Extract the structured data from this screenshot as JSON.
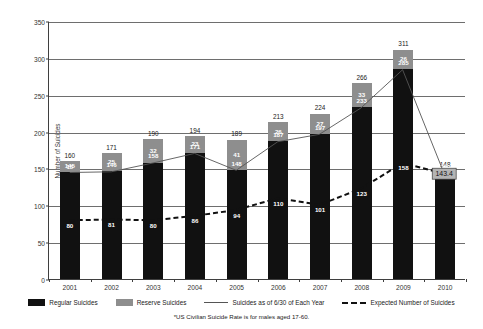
{
  "chart_data": {
    "type": "bar",
    "title": "",
    "xlabel": "",
    "ylabel": "Number of Suicides",
    "ylim": [
      0,
      350
    ],
    "ytick_step": 50,
    "yticks": [
      "0",
      "50",
      "100",
      "150",
      "200",
      "250",
      "300",
      "350"
    ],
    "grid": true,
    "legend_position": "bottom",
    "stacked": true,
    "categories": [
      "2001",
      "2002",
      "2003",
      "2004",
      "2005",
      "2006",
      "2007",
      "2008",
      "2009",
      "2010"
    ],
    "series": [
      {
        "name": "Regular Suicides",
        "type": "bar",
        "color": "#111111",
        "values": [
          145,
          146,
          158,
          171,
          148,
          187,
          197,
          233,
          285,
          139
        ]
      },
      {
        "name": "Reserve Suicides",
        "type": "bar",
        "color": "#8e8e8e",
        "values": [
          15,
          25,
          32,
          23,
          41,
          26,
          27,
          33,
          26,
          9
        ]
      },
      {
        "name": "Suicides as of 6/30 of Each Year",
        "type": "line",
        "style": "solid",
        "color": "#555555",
        "values": [
          145,
          146,
          158,
          171,
          148,
          187,
          197,
          233,
          285,
          143.4
        ]
      },
      {
        "name": "Expected Number of Suicides",
        "type": "line",
        "style": "dashed",
        "color": "#111111",
        "values": [
          80,
          81,
          80,
          86,
          94,
          110,
          101,
          123,
          158,
          143.4
        ]
      }
    ],
    "totals": [
      160,
      171,
      190,
      194,
      189,
      213,
      224,
      266,
      311,
      148
    ],
    "total_labels": [
      "160",
      "171",
      "190",
      "194",
      "189",
      "213",
      "224",
      "266",
      "311",
      "148"
    ],
    "regular_labels": [
      "145",
      "146",
      "158",
      "171",
      "148",
      "187",
      "197",
      "233",
      "285",
      "139"
    ],
    "reserve_labels": [
      "15",
      "25",
      "32",
      "23",
      "41",
      "26",
      "27",
      "33",
      "26",
      "9"
    ],
    "expected_labels": [
      "80",
      "81",
      "80",
      "86",
      "94",
      "110",
      "101",
      "123",
      "158",
      "143.4"
    ],
    "annotations": [
      {
        "text": "143.4",
        "x": "2010",
        "y": 143.4
      }
    ]
  },
  "legend": {
    "items": [
      {
        "label": "Regular Suicides",
        "swatch": "black-square"
      },
      {
        "label": "Reserve Suicides",
        "swatch": "gray-square"
      },
      {
        "label": "Suicides as of 6/30 of Each Year",
        "swatch": "solid-line"
      },
      {
        "label": "Expected Number of Suicides",
        "swatch": "dashed-line"
      }
    ]
  },
  "footnote": {
    "text": "*US Civilian Suicide Rate is for males aged 17-60."
  }
}
